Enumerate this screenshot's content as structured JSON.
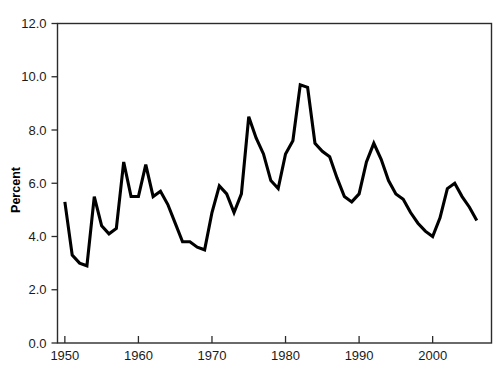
{
  "chart_data": {
    "type": "line",
    "title": "",
    "xlabel": "",
    "ylabel": "Percent",
    "xlim": [
      1949,
      2008
    ],
    "ylim": [
      0.0,
      12.0
    ],
    "grid": false,
    "legend": null,
    "xticks": [
      1950,
      1960,
      1970,
      1980,
      1990,
      2000
    ],
    "xtick_labels": [
      "1950",
      "1960",
      "1970",
      "1980",
      "1990",
      "2000"
    ],
    "yticks": [
      0.0,
      2.0,
      4.0,
      6.0,
      8.0,
      10.0,
      12.0
    ],
    "ytick_labels": [
      "0.0",
      "2.0",
      "4.0",
      "6.0",
      "8.0",
      "10.0",
      "12.0"
    ],
    "series": [
      {
        "name": "Percent",
        "color": "#000000",
        "x": [
          1950,
          1951,
          1952,
          1953,
          1954,
          1955,
          1956,
          1957,
          1958,
          1959,
          1960,
          1961,
          1962,
          1963,
          1964,
          1965,
          1966,
          1967,
          1968,
          1969,
          1970,
          1971,
          1972,
          1973,
          1974,
          1975,
          1976,
          1977,
          1978,
          1979,
          1980,
          1981,
          1982,
          1983,
          1984,
          1985,
          1986,
          1987,
          1988,
          1989,
          1990,
          1991,
          1992,
          1993,
          1994,
          1995,
          1996,
          1997,
          1998,
          1999,
          2000,
          2001,
          2002,
          2003,
          2004,
          2005,
          2006
        ],
        "y": [
          5.3,
          3.3,
          3.0,
          2.9,
          5.5,
          4.4,
          4.1,
          4.3,
          6.8,
          5.5,
          5.5,
          6.7,
          5.5,
          5.7,
          5.2,
          4.5,
          3.8,
          3.8,
          3.6,
          3.5,
          4.9,
          5.9,
          5.6,
          4.9,
          5.6,
          8.5,
          7.7,
          7.1,
          6.1,
          5.8,
          7.1,
          7.6,
          9.7,
          9.6,
          7.5,
          7.2,
          7.0,
          6.2,
          5.5,
          5.3,
          5.6,
          6.8,
          7.5,
          6.9,
          6.1,
          5.6,
          5.4,
          4.9,
          4.5,
          4.2,
          4.0,
          4.7,
          5.8,
          6.0,
          5.5,
          5.1,
          4.6
        ],
        "marker": "none",
        "linewidth": 3
      }
    ]
  },
  "axes": {
    "y_axis_title": "Percent"
  }
}
